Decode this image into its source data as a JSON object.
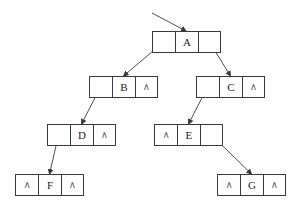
{
  "diagram": {
    "cell_width": 23,
    "node_height": 22,
    "line_color": "#3a3a3a",
    "null_symbol": "∧",
    "root_pointer": {
      "from": [
        152,
        13
      ],
      "to": [
        186,
        31
      ]
    },
    "nodes": [
      {
        "id": "A",
        "x": 152,
        "y": 31,
        "lchild": "",
        "data": "A",
        "rchild": ""
      },
      {
        "id": "B",
        "x": 89,
        "y": 76,
        "lchild": "",
        "data": "B",
        "rchild": "∧"
      },
      {
        "id": "C",
        "x": 196,
        "y": 76,
        "lchild": "",
        "data": "C",
        "rchild": "∧"
      },
      {
        "id": "D",
        "x": 47,
        "y": 124,
        "lchild": "",
        "data": "D",
        "rchild": "∧"
      },
      {
        "id": "E",
        "x": 154,
        "y": 124,
        "lchild": "∧",
        "data": "E",
        "rchild": ""
      },
      {
        "id": "F",
        "x": 15,
        "y": 174,
        "lchild": "∧",
        "data": "F",
        "rchild": "∧"
      },
      {
        "id": "G",
        "x": 217,
        "y": 174,
        "lchild": "∧",
        "data": "G",
        "rchild": "∧"
      }
    ],
    "edges": [
      {
        "from": "A",
        "side": "left",
        "to": "B"
      },
      {
        "from": "A",
        "side": "right",
        "to": "C"
      },
      {
        "from": "B",
        "side": "left",
        "to": "D"
      },
      {
        "from": "C",
        "side": "left",
        "to": "E"
      },
      {
        "from": "D",
        "side": "left",
        "to": "F"
      },
      {
        "from": "E",
        "side": "right",
        "to": "G"
      }
    ]
  }
}
